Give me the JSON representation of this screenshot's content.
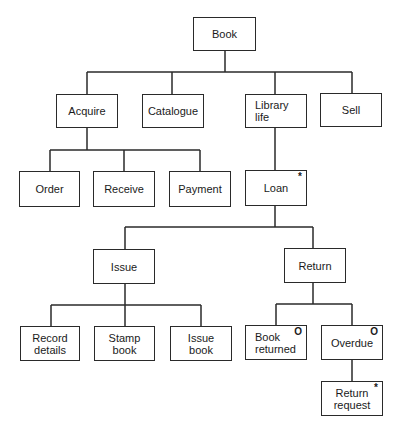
{
  "diagram": {
    "type": "structure-chart",
    "nodes": {
      "book": {
        "label": "Book",
        "marker": ""
      },
      "acquire": {
        "label": "Acquire",
        "marker": ""
      },
      "catalogue": {
        "label": "Catalogue",
        "marker": ""
      },
      "library_life": {
        "label": "Library\nlife",
        "marker": ""
      },
      "sell": {
        "label": "Sell",
        "marker": ""
      },
      "order": {
        "label": "Order",
        "marker": ""
      },
      "receive": {
        "label": "Receive",
        "marker": ""
      },
      "payment": {
        "label": "Payment",
        "marker": ""
      },
      "loan": {
        "label": "Loan",
        "marker": "*"
      },
      "issue": {
        "label": "Issue",
        "marker": ""
      },
      "return": {
        "label": "Return",
        "marker": ""
      },
      "record_details": {
        "label": "Record\ndetails",
        "marker": ""
      },
      "stamp_book": {
        "label": "Stamp\nbook",
        "marker": ""
      },
      "issue_book": {
        "label": "Issue\nbook",
        "marker": ""
      },
      "book_returned": {
        "label": "Book\nreturned",
        "marker": "O"
      },
      "overdue": {
        "label": "Overdue",
        "marker": "O"
      },
      "return_request": {
        "label": "Return\nrequest",
        "marker": "*"
      }
    },
    "edges": [
      [
        "book",
        "acquire"
      ],
      [
        "book",
        "catalogue"
      ],
      [
        "book",
        "library_life"
      ],
      [
        "book",
        "sell"
      ],
      [
        "acquire",
        "order"
      ],
      [
        "acquire",
        "receive"
      ],
      [
        "acquire",
        "payment"
      ],
      [
        "library_life",
        "loan"
      ],
      [
        "loan",
        "issue"
      ],
      [
        "loan",
        "return"
      ],
      [
        "issue",
        "record_details"
      ],
      [
        "issue",
        "stamp_book"
      ],
      [
        "issue",
        "issue_book"
      ],
      [
        "return",
        "book_returned"
      ],
      [
        "return",
        "overdue"
      ],
      [
        "overdue",
        "return_request"
      ]
    ]
  }
}
